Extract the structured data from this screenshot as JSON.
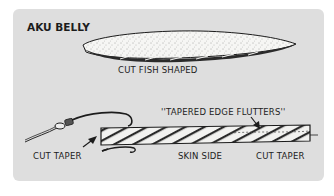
{
  "title": "AKU BELLY",
  "labels": {
    "top_bait": "CUT FISH SHAPED",
    "flutter": "''TAPERED EDGE FLUTTERS''",
    "left_taper": "CUT TAPER",
    "skin": "SKIN SIDE",
    "right_taper": "CUT TAPER"
  },
  "colors": {
    "panel": "#dedede",
    "ink": "#1c1c1c",
    "bait_fill": "#f4f4f2"
  }
}
